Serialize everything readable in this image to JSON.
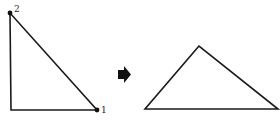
{
  "diagram": {
    "left_triangle": {
      "vertices": [
        {
          "label": "2",
          "x": 10,
          "y": 13,
          "marked": true
        },
        {
          "label": "",
          "x": 11,
          "y": 110,
          "marked": false
        },
        {
          "label": "1",
          "x": 97,
          "y": 110,
          "marked": true
        }
      ]
    },
    "arrow": {
      "direction": "right",
      "color": "#111111"
    },
    "right_triangle": {
      "vertices": [
        {
          "x": 199,
          "y": 46
        },
        {
          "x": 145,
          "y": 109
        },
        {
          "x": 278,
          "y": 109
        }
      ]
    },
    "colors": {
      "stroke": "#1a1a1a",
      "background": "#ffffff"
    }
  }
}
